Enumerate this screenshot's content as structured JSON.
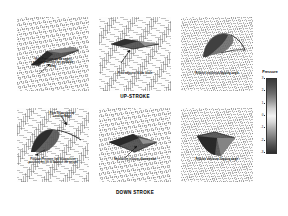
{
  "figure": {
    "rows": [
      {
        "label": "UP-STROKE",
        "panels": [
          {
            "name": "upstroke-panel-1",
            "annotation": "High Pressure on the upper\nsurface produced net probable\ndrag"
          },
          {
            "name": "upstroke-panel-2",
            "annotation": "Fluid adjacent to the blade"
          },
          {
            "name": "upstroke-panel-3",
            "annotation": "Relative maximum flapping angle"
          }
        ]
      },
      {
        "label": "DOWN STROKE",
        "panels": [
          {
            "name": "downstroke-panel-1",
            "annotation_top": "Flow Separation at\nLeading Edge",
            "annotation": "Positive Pressure link to impulsive\nposition, net lift to balance the weight"
          },
          {
            "name": "downstroke-panel-2",
            "annotation": "Separation initiates downstream"
          },
          {
            "name": "downstroke-panel-3",
            "annotation": "Relative minimum flapping angle"
          }
        ]
      }
    ]
  },
  "colorbar": {
    "title": "Pressure",
    "ticks": [
      "3",
      "2",
      "1",
      "0",
      "-1",
      "-2",
      "-3"
    ],
    "min": -3,
    "max": 3,
    "high_color": "#3a3a3a",
    "mid_color": "#f2f2f2",
    "low_color": "#2e2e2e"
  },
  "chart_data": {
    "type": "heatmap",
    "title": "",
    "xlabel": "",
    "ylabel": "",
    "colorbar_label": "Pressure",
    "colorbar_ticks": [
      3,
      2,
      1,
      0,
      -1,
      -2,
      -3
    ],
    "clim": [
      -3,
      3
    ],
    "grid": true,
    "legend_position": "right",
    "panels": [
      {
        "row": "UP-STROKE",
        "index": 1,
        "annotation": "High Pressure on the upper surface produced net probable drag"
      },
      {
        "row": "UP-STROKE",
        "index": 2,
        "annotation": "Fluid adjacent to the blade"
      },
      {
        "row": "UP-STROKE",
        "index": 3,
        "annotation": "Relative maximum flapping angle"
      },
      {
        "row": "DOWN STROKE",
        "index": 1,
        "annotation": "Flow Separation at Leading Edge / Positive Pressure link to impulsive position, net lift to balance the weight"
      },
      {
        "row": "DOWN STROKE",
        "index": 2,
        "annotation": "Separation initiates downstream"
      },
      {
        "row": "DOWN STROKE",
        "index": 3,
        "annotation": "Relative minimum flapping angle"
      }
    ]
  }
}
